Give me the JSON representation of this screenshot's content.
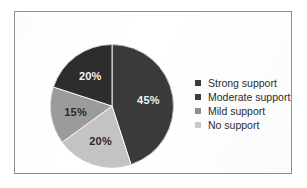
{
  "figure": {
    "background_color": "#ffffff",
    "frame_color": "#8e8e8e"
  },
  "chart_data": {
    "type": "pie",
    "title": "",
    "categories": [
      "Strong support",
      "Moderate support",
      "Mild support",
      "No support"
    ],
    "values": [
      45,
      20,
      15,
      20
    ],
    "value_labels": [
      "45%",
      "20%",
      "20%",
      "15%"
    ],
    "unit": "%",
    "start_angle_deg": 0,
    "direction": "clockwise",
    "colors": [
      "#3a3a3a",
      "#c3c3c3",
      "#9b9b9b",
      "#2d2d2d"
    ],
    "legend_position": "right",
    "slice_label_color": "#ffffff",
    "slices": [
      {
        "label": "Strong support",
        "value": 45,
        "display": "45%",
        "color": "#3a3a3a",
        "label_color": "#f2f2f2",
        "label_x": 78,
        "label_y": 47
      },
      {
        "label": "Moderate support",
        "value": 20,
        "display": "20%",
        "color": "#c3c3c3",
        "label_color": "#2a2a2a",
        "label_x": 42,
        "label_y": 96
      },
      {
        "label": "Mild support",
        "value": 15,
        "display": "15%",
        "color": "#9b9b9b",
        "label_color": "#2a2a2a",
        "label_x": 18,
        "label_y": 67
      },
      {
        "label": "No support",
        "value": 20,
        "display": "20%",
        "color": "#2d2d2d",
        "label_color": "#f2f2f2",
        "label_x": 33,
        "label_y": 30
      }
    ]
  },
  "legend": {
    "items": [
      {
        "label": "Strong support",
        "color": "#3a3a3a"
      },
      {
        "label": "Moderate support",
        "color": "#3f3f3f"
      },
      {
        "label": "Mild support",
        "color": "#8f8f8f"
      },
      {
        "label": "No support",
        "color": "#c9c9c9"
      }
    ]
  }
}
